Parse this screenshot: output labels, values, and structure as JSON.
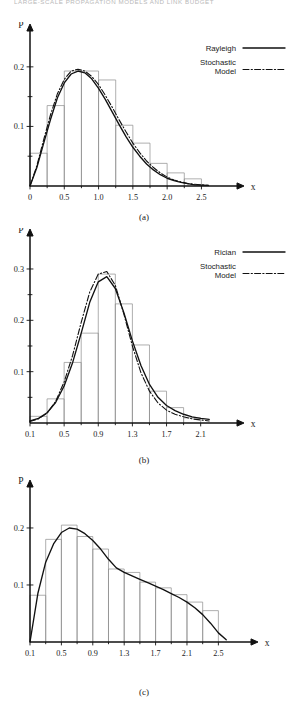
{
  "running_head": "LARGE-SCALE PROPAGATION MODELS AND LINK BUDGET",
  "figures": [
    {
      "id": "a",
      "caption": "(a)",
      "legend": [
        {
          "label": "Rayleigh",
          "style": "solid"
        },
        {
          "label": "Stochastic Model",
          "style": "dash-dot"
        }
      ],
      "chart_data": {
        "type": "bar",
        "title": "",
        "xlabel": "x",
        "ylabel": "P",
        "xlim": [
          0,
          2.8
        ],
        "ylim": [
          0,
          0.235
        ],
        "xticks": [
          "0",
          "0.5",
          "1.0",
          "1.5",
          "2.0",
          "2.5"
        ],
        "xtick_values": [
          0,
          0.5,
          1.0,
          1.5,
          2.0,
          2.5
        ],
        "yticks": [
          "0.1",
          "0.2"
        ],
        "ytick_values": [
          0.1,
          0.2
        ],
        "yminor_values": [
          0.05,
          0.15
        ],
        "grid": false,
        "legend_position": "top-right",
        "bin_edges": [
          0.0,
          0.25,
          0.5,
          0.75,
          1.0,
          1.25,
          1.5,
          1.75,
          2.0,
          2.25,
          2.5
        ],
        "bin_heights": [
          0.055,
          0.135,
          0.193,
          0.193,
          0.178,
          0.102,
          0.072,
          0.038,
          0.022,
          0.012
        ],
        "series": [
          {
            "name": "Rayleigh",
            "style": "solid",
            "x": [
              0.0,
              0.1,
              0.2,
              0.3,
              0.4,
              0.5,
              0.6,
              0.7,
              0.8,
              0.9,
              1.0,
              1.1,
              1.2,
              1.3,
              1.4,
              1.5,
              1.6,
              1.7,
              1.8,
              1.9,
              2.0,
              2.1,
              2.2,
              2.3,
              2.4,
              2.5,
              2.6
            ],
            "y": [
              0.0,
              0.031,
              0.072,
              0.112,
              0.148,
              0.173,
              0.188,
              0.193,
              0.19,
              0.18,
              0.164,
              0.145,
              0.124,
              0.103,
              0.083,
              0.065,
              0.05,
              0.037,
              0.027,
              0.019,
              0.013,
              0.009,
              0.006,
              0.004,
              0.002,
              0.0015,
              0.001
            ]
          },
          {
            "name": "Stochastic Model",
            "style": "dash-dot",
            "x": [
              0.0,
              0.1,
              0.2,
              0.3,
              0.4,
              0.5,
              0.6,
              0.7,
              0.8,
              0.9,
              1.0,
              1.1,
              1.2,
              1.3,
              1.4,
              1.5,
              1.6,
              1.7,
              1.8,
              1.9,
              2.0,
              2.1,
              2.2,
              2.3,
              2.4,
              2.5,
              2.6
            ],
            "y": [
              0.0,
              0.034,
              0.078,
              0.12,
              0.155,
              0.179,
              0.193,
              0.196,
              0.193,
              0.184,
              0.17,
              0.152,
              0.132,
              0.111,
              0.091,
              0.072,
              0.056,
              0.042,
              0.031,
              0.022,
              0.015,
              0.01,
              0.007,
              0.004,
              0.003,
              0.002,
              0.001
            ]
          }
        ]
      }
    },
    {
      "id": "b",
      "caption": "(b)",
      "legend": [
        {
          "label": "Rician",
          "style": "solid"
        },
        {
          "label": "Stochastic Model",
          "style": "dash-dot"
        }
      ],
      "chart_data": {
        "type": "bar",
        "title": "",
        "xlabel": "x",
        "ylabel": "P",
        "xlim": [
          0.1,
          2.35
        ],
        "ylim": [
          0,
          0.335
        ],
        "xticks": [
          "0.1",
          "0.5",
          "0.9",
          "1.3",
          "1.7",
          "2.1"
        ],
        "xtick_values": [
          0.1,
          0.5,
          0.9,
          1.3,
          1.7,
          2.1
        ],
        "yticks": [
          "0.1",
          "0.2",
          "0.3"
        ],
        "ytick_values": [
          0.1,
          0.2,
          0.3
        ],
        "yminor_values": [
          0.05,
          0.15,
          0.25
        ],
        "grid": false,
        "legend_position": "top-right",
        "bin_edges": [
          0.1,
          0.3,
          0.5,
          0.7,
          0.9,
          1.1,
          1.3,
          1.5,
          1.7,
          1.9,
          2.1
        ],
        "bin_heights": [
          0.013,
          0.047,
          0.118,
          0.175,
          0.29,
          0.232,
          0.152,
          0.062,
          0.03,
          0.01
        ],
        "series": [
          {
            "name": "Rician",
            "style": "solid",
            "x": [
              0.1,
              0.2,
              0.3,
              0.4,
              0.5,
              0.6,
              0.7,
              0.8,
              0.9,
              1.0,
              1.1,
              1.2,
              1.3,
              1.4,
              1.5,
              1.6,
              1.7,
              1.8,
              1.9,
              2.0,
              2.1,
              2.2
            ],
            "y": [
              0.004,
              0.009,
              0.02,
              0.04,
              0.072,
              0.118,
              0.175,
              0.235,
              0.275,
              0.285,
              0.262,
              0.215,
              0.16,
              0.112,
              0.075,
              0.05,
              0.034,
              0.024,
              0.017,
              0.012,
              0.009,
              0.007
            ]
          },
          {
            "name": "Stochastic Model",
            "style": "dash-dot",
            "x": [
              0.1,
              0.2,
              0.3,
              0.4,
              0.5,
              0.6,
              0.7,
              0.8,
              0.9,
              1.0,
              1.1,
              1.2,
              1.3,
              1.4,
              1.5,
              1.6,
              1.7,
              1.8,
              1.9,
              2.0,
              2.1,
              2.2
            ],
            "y": [
              0.003,
              0.008,
              0.019,
              0.042,
              0.08,
              0.132,
              0.196,
              0.255,
              0.29,
              0.295,
              0.268,
              0.212,
              0.15,
              0.098,
              0.062,
              0.039,
              0.025,
              0.017,
              0.012,
              0.008,
              0.006,
              0.004
            ]
          }
        ]
      }
    },
    {
      "id": "c",
      "caption": "(c)",
      "legend": [],
      "chart_data": {
        "type": "bar",
        "title": "",
        "xlabel": "x",
        "ylabel": "P",
        "xlim": [
          0.1,
          2.75
        ],
        "ylim": [
          0,
          0.235
        ],
        "xticks": [
          "0.1",
          "0.5",
          "0.9",
          "1.3",
          "1.7",
          "2.1",
          "2.5"
        ],
        "xtick_values": [
          0.1,
          0.5,
          0.9,
          1.3,
          1.7,
          2.1,
          2.5
        ],
        "yticks": [
          "0.1",
          "0.2"
        ],
        "ytick_values": [
          0.1,
          0.2
        ],
        "yminor_values": [],
        "grid": false,
        "legend_position": "none",
        "bin_edges": [
          0.1,
          0.3,
          0.5,
          0.7,
          0.9,
          1.1,
          1.3,
          1.5,
          1.7,
          1.9,
          2.1,
          2.3,
          2.5
        ],
        "bin_heights": [
          0.082,
          0.18,
          0.205,
          0.185,
          0.163,
          0.128,
          0.122,
          0.105,
          0.095,
          0.083,
          0.07,
          0.055
        ],
        "series": [
          {
            "name": "Distribution",
            "style": "solid",
            "x": [
              0.1,
              0.2,
              0.3,
              0.4,
              0.5,
              0.6,
              0.7,
              0.8,
              0.9,
              1.0,
              1.1,
              1.2,
              1.3,
              1.4,
              1.5,
              1.6,
              1.7,
              1.8,
              1.9,
              2.0,
              2.1,
              2.2,
              2.3,
              2.4,
              2.5,
              2.6
            ],
            "y": [
              0.0,
              0.085,
              0.14,
              0.172,
              0.192,
              0.2,
              0.198,
              0.19,
              0.178,
              0.163,
              0.145,
              0.13,
              0.122,
              0.116,
              0.11,
              0.104,
              0.098,
              0.092,
              0.085,
              0.078,
              0.07,
              0.06,
              0.048,
              0.033,
              0.016,
              0.004
            ]
          }
        ]
      }
    }
  ]
}
